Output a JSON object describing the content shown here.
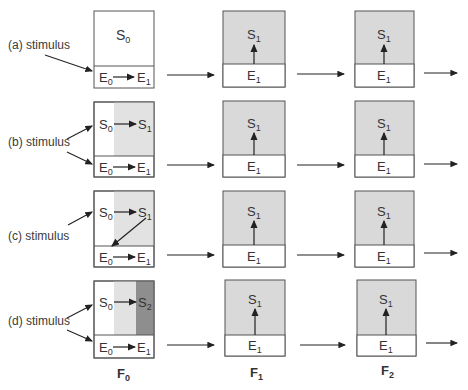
{
  "colors": {
    "light_gray": "#e2e2e2",
    "mid_gray": "#d9d9d9",
    "dark_gray": "#8e8e8e",
    "line": "#555555",
    "arrow": "#222222"
  },
  "rows": [
    {
      "label": "(a)  stimulus",
      "f0_top": {
        "left": "S",
        "left_sub": "0"
      },
      "f0_bottom": {
        "left": "E",
        "left_sub": "0",
        "right": "E",
        "right_sub": "1"
      }
    },
    {
      "label": "(b)  stimulus",
      "f0_top": {
        "left": "S",
        "left_sub": "0",
        "right": "S",
        "right_sub": "1"
      },
      "f0_bottom": {
        "left": "E",
        "left_sub": "0",
        "right": "E",
        "right_sub": "1"
      }
    },
    {
      "label": "(c)  stimulus",
      "f0_top": {
        "left": "S",
        "left_sub": "0",
        "right": "S",
        "right_sub": "1"
      },
      "f0_bottom": {
        "left": "E",
        "left_sub": "0",
        "right": "E",
        "right_sub": "1"
      }
    },
    {
      "label": "(d)  stimulus",
      "f0_top": {
        "left": "S",
        "left_sub": "0",
        "right": "S",
        "right_sub": "2"
      },
      "f0_bottom": {
        "left": "E",
        "left_sub": "0",
        "right": "E",
        "right_sub": "1"
      }
    }
  ],
  "later_box": {
    "top": "S",
    "top_sub": "1",
    "bottom": "E",
    "bottom_sub": "1"
  },
  "columns": [
    {
      "label": "F",
      "sub": "0"
    },
    {
      "label": "F",
      "sub": "1"
    },
    {
      "label": "F",
      "sub": "2"
    }
  ]
}
